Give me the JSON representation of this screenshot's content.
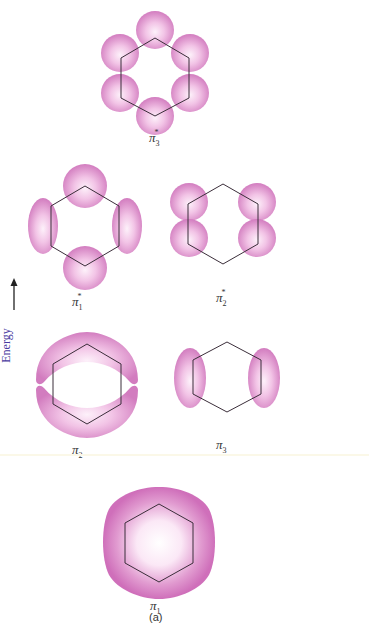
{
  "figure": {
    "caption": "(a)",
    "axis": {
      "label": "Energy",
      "direction": "up-arrow"
    },
    "colors": {
      "lobe": "#d67fc2",
      "lobe_light": "#fbe6f5",
      "ring": "#3b2e3a",
      "axis_text": "#4a3aa0"
    },
    "orbitals": [
      {
        "id": "pi3-star",
        "symbol": "π",
        "subscript": "3",
        "superscript": "*",
        "level": 4,
        "description": "six lobes, one per carbon"
      },
      {
        "id": "pi1-star",
        "symbol": "π",
        "subscript": "1",
        "superscript": "*",
        "level": 3,
        "description": "four lobes: top, bottom, left, right"
      },
      {
        "id": "pi2-star",
        "symbol": "π",
        "subscript": "2",
        "superscript": "*",
        "level": 3,
        "description": "four lobes at side carbons"
      },
      {
        "id": "pi2",
        "symbol": "π",
        "subscript": "2",
        "superscript": "",
        "level": 2,
        "description": "two crescent lobes top and bottom"
      },
      {
        "id": "pi3",
        "symbol": "π",
        "subscript": "3",
        "superscript": "",
        "level": 2,
        "description": "two elongated lobes left and right"
      },
      {
        "id": "pi1",
        "symbol": "π",
        "subscript": "1",
        "superscript": "",
        "level": 1,
        "description": "continuous ring lobe"
      }
    ]
  }
}
